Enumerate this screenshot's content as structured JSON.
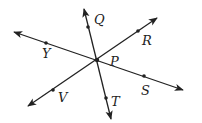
{
  "diagram": {
    "type": "geometry-lines",
    "colors": {
      "stroke": "#222222",
      "background": "#ffffff"
    },
    "intersection": {
      "label": "P",
      "x": 97,
      "y": 60
    },
    "lines": [
      {
        "id": "line-YS",
        "start": {
          "x": 14,
          "y": 32
        },
        "end": {
          "x": 183,
          "y": 90
        },
        "points": [
          {
            "label": "Y",
            "x": 46,
            "y": 43,
            "label_x": 43,
            "label_y": 57
          },
          {
            "label": "S",
            "x": 144,
            "y": 76,
            "label_x": 141,
            "label_y": 94
          }
        ]
      },
      {
        "id": "line-QT",
        "start": {
          "x": 84,
          "y": 9
        },
        "end": {
          "x": 111,
          "y": 119
        },
        "points": [
          {
            "label": "Q",
            "x": 88,
            "y": 27,
            "label_x": 94,
            "label_y": 24
          },
          {
            "label": "T",
            "x": 106,
            "y": 98,
            "label_x": 111,
            "label_y": 106
          }
        ]
      },
      {
        "id": "line-RV",
        "start": {
          "x": 157,
          "y": 18
        },
        "end": {
          "x": 28,
          "y": 106
        },
        "points": [
          {
            "label": "R",
            "x": 138,
            "y": 31,
            "label_x": 142,
            "label_y": 45
          },
          {
            "label": "V",
            "x": 53,
            "y": 90,
            "label_x": 59,
            "label_y": 101
          }
        ]
      }
    ],
    "labels": {
      "P": "P",
      "Q": "Q",
      "R": "R",
      "S": "S",
      "T": "T",
      "V": "V",
      "Y": "Y"
    }
  }
}
